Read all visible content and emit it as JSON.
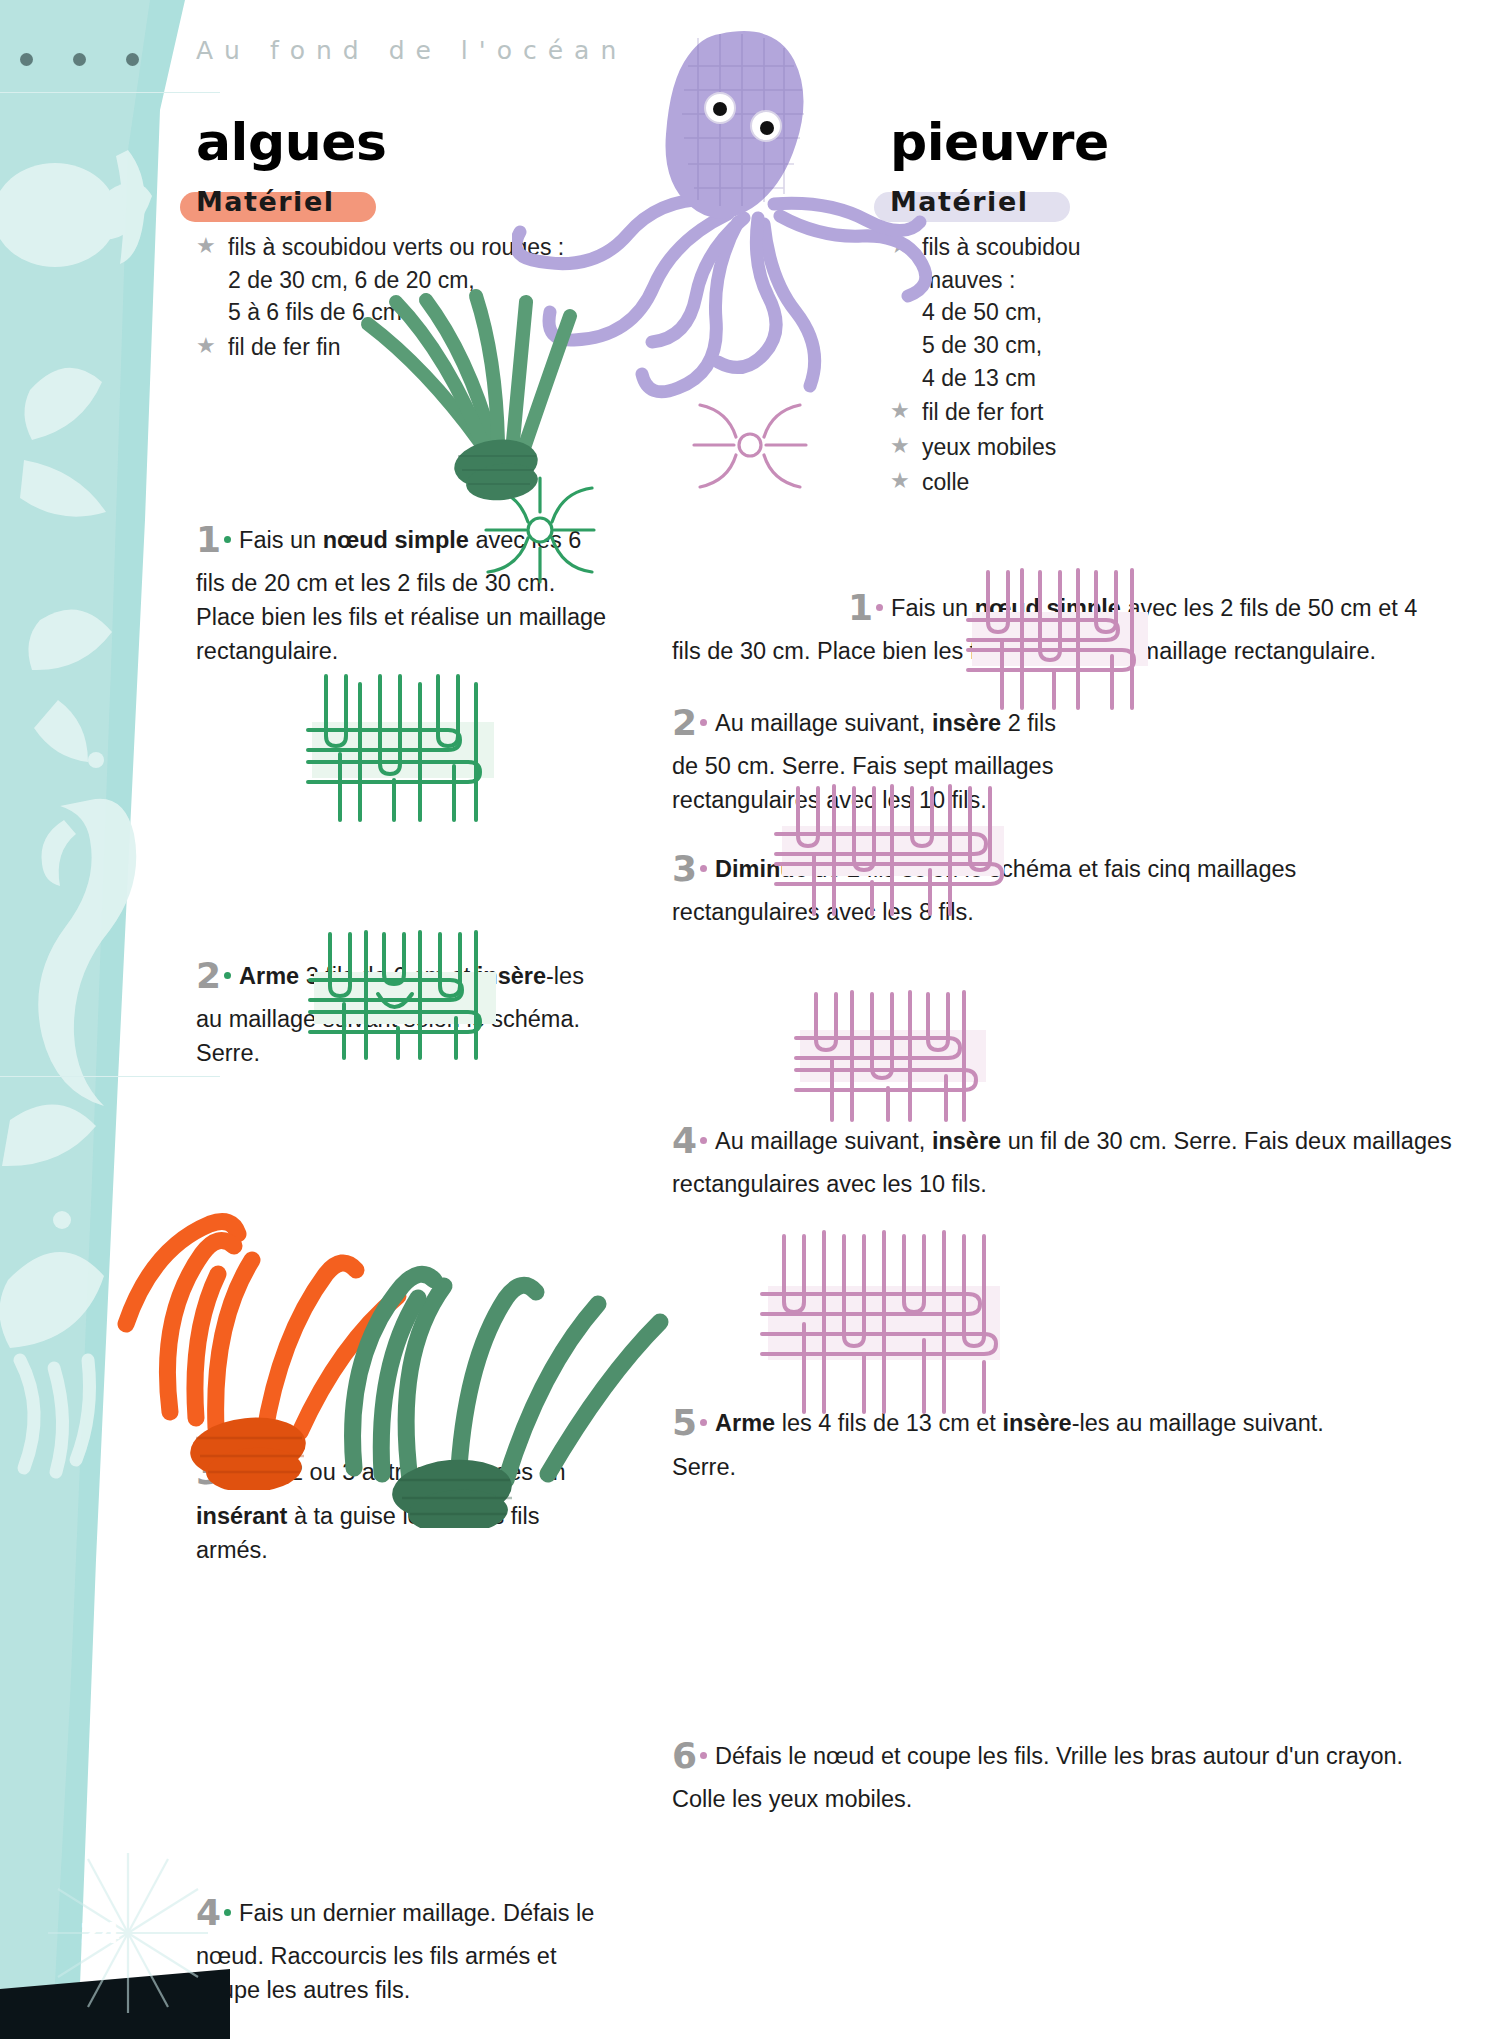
{
  "running_head": "Au fond de l'océan",
  "page_number": "24",
  "colors": {
    "teal_band": "#ade0dd",
    "orange_swash": "#f3977b",
    "lilac_swash": "#e2e0ef",
    "green_diagram": "#2f9e63",
    "pink_diagram": "#c78cb8",
    "step_number_gray": "#9b9b9b",
    "star_gray": "#a9abad"
  },
  "projects": [
    {
      "id": "algues",
      "title": "algues",
      "materiel_label": "Matériel",
      "materials": [
        "fils à scoubidou verts ou rouges :\n2 de 30 cm, 6 de 20 cm,\n5 à 6 fils de 6 cm",
        "fil de fer fin"
      ],
      "steps": [
        {
          "number": "1",
          "parts": [
            {
              "t": "Fais un ",
              "b": false
            },
            {
              "t": "nœud simple",
              "b": true
            },
            {
              "t": " avec les 6 fils de 20 cm et les 2 fils de 30 cm. Place bien les fils et réalise un maillage rectangulaire.",
              "b": false
            }
          ]
        },
        {
          "number": "2",
          "parts": [
            {
              "t": "Arme",
              "b": true
            },
            {
              "t": " 3 fils de 6 cm et ",
              "b": false
            },
            {
              "t": "insère",
              "b": true
            },
            {
              "t": "-les au maillage suivant selon le schéma. Serre.",
              "b": false
            }
          ]
        },
        {
          "number": "3",
          "parts": [
            {
              "t": "Fais 2 ou 3 autres maillages en ",
              "b": false
            },
            {
              "t": "insérant",
              "b": true
            },
            {
              "t": " à ta guise les autres fils armés.",
              "b": false
            }
          ]
        },
        {
          "number": "4",
          "parts": [
            {
              "t": "Fais un dernier maillage. Défais le nœud. Raccourcis les fils armés et coupe les autres fils.",
              "b": false
            }
          ]
        }
      ]
    },
    {
      "id": "pieuvre",
      "title": "pieuvre",
      "materiel_label": "Matériel",
      "materials": [
        "fils à scoubidou\nmauves :\n4 de 50 cm,\n5 de 30 cm,\n4 de 13 cm",
        "fil de fer fort",
        "yeux mobiles",
        "colle"
      ],
      "steps": [
        {
          "number": "1",
          "parts": [
            {
              "t": "Fais un ",
              "b": false
            },
            {
              "t": "nœud simple",
              "b": true
            },
            {
              "t": " avec les 2 fils de 50 cm et 4 fils de 30 cm. Place bien les fils et réalise un maillage rectangulaire.",
              "b": false
            }
          ]
        },
        {
          "number": "2",
          "parts": [
            {
              "t": "Au maillage suivant, ",
              "b": false
            },
            {
              "t": "insère",
              "b": true
            },
            {
              "t": " 2 fils de 50 cm. Serre. Fais sept maillages rectangulaires avec les 10 fils.",
              "b": false
            }
          ]
        },
        {
          "number": "3",
          "parts": [
            {
              "t": "Diminue",
              "b": true
            },
            {
              "t": " de 2 fils selon le schéma et fais cinq maillages rectangulaires avec les 8 fils.",
              "b": false
            }
          ]
        },
        {
          "number": "4",
          "parts": [
            {
              "t": "Au maillage suivant, ",
              "b": false
            },
            {
              "t": "insère",
              "b": true
            },
            {
              "t": " un fil de 30 cm. Serre. Fais deux maillages rectangulaires avec les 10 fils.",
              "b": false
            }
          ]
        },
        {
          "number": "5",
          "parts": [
            {
              "t": "Arme",
              "b": true
            },
            {
              "t": " les 4 fils de 13 cm et ",
              "b": false
            },
            {
              "t": "insère",
              "b": true
            },
            {
              "t": "-les au maillage suivant. Serre.",
              "b": false
            }
          ]
        },
        {
          "number": "6",
          "parts": [
            {
              "t": "Défais le nœud et coupe les fils. Vrille les bras autour d'un crayon. Colle les yeux mobiles.",
              "b": false
            }
          ]
        }
      ]
    }
  ],
  "diagrams": [
    {
      "id": "algues-knot",
      "type": "simple-knot",
      "color": "#2f9e63"
    },
    {
      "id": "algues-weave-1",
      "type": "weave",
      "color": "#2f9e63"
    },
    {
      "id": "algues-weave-2",
      "type": "weave",
      "color": "#2f9e63"
    },
    {
      "id": "pieuvre-knot",
      "type": "simple-knot",
      "color": "#c78cb8"
    },
    {
      "id": "pieuvre-weave-1",
      "type": "weave",
      "color": "#c78cb8"
    },
    {
      "id": "pieuvre-weave-2",
      "type": "weave",
      "color": "#c78cb8"
    },
    {
      "id": "pieuvre-weave-3",
      "type": "weave",
      "color": "#c78cb8"
    },
    {
      "id": "pieuvre-weave-4",
      "type": "weave",
      "color": "#c78cb8"
    }
  ],
  "photos": [
    {
      "id": "octopus-photo",
      "alt": "pieuvre en scoubidou mauve"
    },
    {
      "id": "seaweed-green-photo",
      "alt": "algues vertes en scoubidou"
    },
    {
      "id": "seaweed-orange-photo",
      "alt": "algues orange en scoubidou"
    },
    {
      "id": "seaweed-top-photo",
      "alt": "algues vertes en cours de réalisation"
    }
  ]
}
